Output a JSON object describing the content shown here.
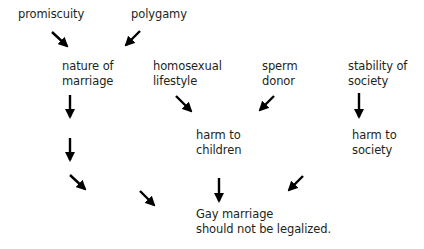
{
  "diagram": {
    "type": "argument-map",
    "nodes": {
      "promiscuity": {
        "lines": [
          "promiscuity"
        ]
      },
      "polygamy": {
        "lines": [
          "polygamy"
        ]
      },
      "nature_of_marriage": {
        "lines": [
          "nature of",
          "marriage"
        ]
      },
      "homosexual_lifestyle": {
        "lines": [
          "homosexual",
          "lifestyle"
        ]
      },
      "sperm_donor": {
        "lines": [
          "sperm",
          "donor"
        ]
      },
      "stability_of_society": {
        "lines": [
          "stability of",
          "society"
        ]
      },
      "harm_to_children": {
        "lines": [
          "harm to",
          "children"
        ]
      },
      "harm_to_society": {
        "lines": [
          "harm to",
          "society"
        ]
      },
      "conclusion": {
        "lines": [
          "Gay marriage",
          "should not be legalized."
        ]
      }
    },
    "edges": [
      {
        "from": "promiscuity",
        "to": "nature_of_marriage",
        "direction": "down-right"
      },
      {
        "from": "polygamy",
        "to": "nature_of_marriage",
        "direction": "down-left"
      },
      {
        "from": "nature_of_marriage",
        "to": "conclusion",
        "direction": "down"
      },
      {
        "from": "homosexual_lifestyle",
        "to": "harm_to_children",
        "direction": "down-right"
      },
      {
        "from": "sperm_donor",
        "to": "harm_to_children",
        "direction": "down-left"
      },
      {
        "from": "stability_of_society",
        "to": "harm_to_society",
        "direction": "down"
      },
      {
        "from": "harm_to_children",
        "to": "conclusion",
        "direction": "down"
      },
      {
        "from": "harm_to_society",
        "to": "conclusion",
        "direction": "down-left"
      }
    ],
    "arrow_color": "#000000",
    "text_color": "#231f20"
  }
}
